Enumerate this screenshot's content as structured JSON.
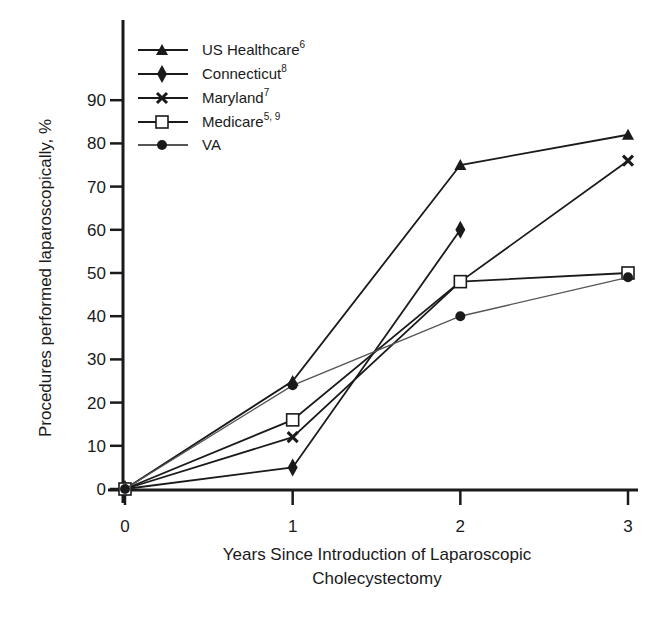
{
  "chart_data": {
    "type": "line",
    "title": "",
    "xlabel": "Years Since Introduction of Laparoscopic Cholecystectomy",
    "xlabel_lines": [
      "Years Since Introduction of Laparoscopic",
      "Cholecystectomy"
    ],
    "ylabel": "Procedures performed laparoscopically, %",
    "x": [
      0,
      1,
      2,
      3
    ],
    "x_ticks": [
      "0",
      "1",
      "2",
      "3"
    ],
    "y_ticks": [
      "0",
      "10",
      "20",
      "30",
      "40",
      "50",
      "60",
      "70",
      "80",
      "90"
    ],
    "xlim": [
      0,
      3
    ],
    "ylim": [
      0,
      100
    ],
    "grid": false,
    "legend_position": "upper-left",
    "series": [
      {
        "name": "US Healthcare",
        "superscript": "6",
        "marker": "triangle",
        "color": "#1a1a1a",
        "x": [
          0,
          1,
          2,
          3
        ],
        "values": [
          0,
          25,
          75,
          82
        ]
      },
      {
        "name": "Connecticut",
        "superscript": "8",
        "marker": "diamond",
        "color": "#1a1a1a",
        "x": [
          0,
          1,
          2
        ],
        "values": [
          0,
          5,
          60
        ]
      },
      {
        "name": "Maryland",
        "superscript": "7",
        "marker": "x",
        "color": "#1a1a1a",
        "x": [
          0,
          1,
          2,
          3
        ],
        "values": [
          0,
          12,
          48,
          76
        ]
      },
      {
        "name": "Medicare",
        "superscript": "5, 9",
        "marker": "square-open",
        "color": "#1a1a1a",
        "x": [
          0,
          1,
          2,
          3
        ],
        "values": [
          0,
          16,
          48,
          50
        ]
      },
      {
        "name": "VA",
        "superscript": "",
        "marker": "circle",
        "color": "#555555",
        "x": [
          0,
          1,
          2,
          3
        ],
        "values": [
          0,
          24,
          40,
          49
        ]
      }
    ]
  }
}
